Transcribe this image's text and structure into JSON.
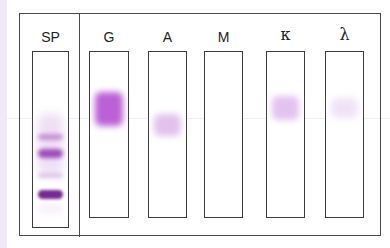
{
  "figure": {
    "lanes": [
      {
        "id": "sp",
        "label": "SP",
        "description": "Serum protein electrophoresis",
        "x": 32,
        "width": 37,
        "height": 177,
        "bands": [
          {
            "y": 265,
            "rel_top": 62,
            "height": 60,
            "color": "#e2c5ec",
            "opacity": 0.55,
            "blur": 5
          },
          {
            "rel_top": 82,
            "height": 6,
            "color": "#a85cc2",
            "opacity": 0.6,
            "blur": 2
          },
          {
            "rel_top": 97,
            "height": 9,
            "color": "#8f34b0",
            "opacity": 0.85,
            "blur": 2
          },
          {
            "rel_top": 121,
            "height": 5,
            "color": "#c79ad9",
            "opacity": 0.55,
            "blur": 2
          },
          {
            "rel_top": 138,
            "height": 9,
            "color": "#6e1e8c",
            "opacity": 0.95,
            "blur": 1.5
          },
          {
            "rel_top": 152,
            "height": 10,
            "color": "#ecdcf2",
            "opacity": 0.4,
            "blur": 3
          }
        ]
      },
      {
        "id": "g",
        "label": "G",
        "description": "IgG",
        "x": 89,
        "width": 40,
        "height": 167,
        "bands": [
          {
            "rel_top": 40,
            "height": 34,
            "color": "#b44fd1",
            "opacity": 0.9,
            "blur": 3
          }
        ]
      },
      {
        "id": "a",
        "label": "A",
        "description": "IgA",
        "x": 148,
        "width": 39,
        "height": 167,
        "bands": [
          {
            "rel_top": 62,
            "height": 22,
            "color": "#dbb3e8",
            "opacity": 0.8,
            "blur": 3
          }
        ]
      },
      {
        "id": "m",
        "label": "M",
        "description": "IgM",
        "x": 204,
        "width": 39,
        "height": 167,
        "bands": []
      },
      {
        "id": "kappa",
        "label": "κ",
        "description": "Kappa light chain",
        "x": 266,
        "width": 39,
        "height": 167,
        "bands": [
          {
            "rel_top": 44,
            "height": 24,
            "color": "#dcb4ec",
            "opacity": 0.8,
            "blur": 3
          }
        ]
      },
      {
        "id": "lambda",
        "label": "λ",
        "description": "Lambda light chain",
        "x": 325,
        "width": 39,
        "height": 167,
        "bands": [
          {
            "rel_top": 46,
            "height": 20,
            "color": "#eddcf5",
            "opacity": 0.8,
            "blur": 3
          }
        ]
      }
    ]
  },
  "labels": {
    "sp": "SP",
    "g": "G",
    "a": "A",
    "m": "M",
    "kappa": "κ",
    "lambda": "λ"
  },
  "colors": {
    "frame": "#4a4a4a",
    "strong_band": "#6e1e8c",
    "igg_band": "#b44fd1",
    "background": "#ffffff",
    "left_strip": "#f1e9f7"
  }
}
